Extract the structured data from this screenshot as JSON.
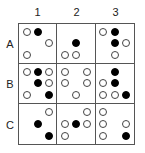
{
  "columns": [
    "1",
    "2",
    "3"
  ],
  "rows": [
    "A",
    "B",
    "C"
  ],
  "legend": {
    "w": "white circle",
    "b": "black circle",
    "-": "empty"
  },
  "colors": {
    "grid_line": "#555555",
    "black_dot": "#000000",
    "white_dot": "#ffffff"
  },
  "cells": {
    "A1": [
      [
        "w",
        "b",
        "-"
      ],
      [
        "-",
        "-",
        "w"
      ],
      [
        "w",
        "-",
        "-"
      ]
    ],
    "A2": [
      [
        "-",
        "-",
        "-"
      ],
      [
        "-",
        "b",
        "-"
      ],
      [
        "w",
        "w",
        "-"
      ]
    ],
    "A3": [
      [
        "w",
        "b",
        "-"
      ],
      [
        "-",
        "b",
        "w"
      ],
      [
        "-",
        "w",
        "-"
      ]
    ],
    "B1": [
      [
        "w",
        "b",
        "w"
      ],
      [
        "-",
        "b",
        "w"
      ],
      [
        "w",
        "-",
        "b"
      ]
    ],
    "B2": [
      [
        "w",
        "-",
        "w"
      ],
      [
        "w",
        "-",
        "w"
      ],
      [
        "-",
        "w",
        "-"
      ]
    ],
    "B3": [
      [
        "-",
        "b",
        "-"
      ],
      [
        "w",
        "b",
        "-"
      ],
      [
        "w",
        "w",
        "b"
      ]
    ],
    "C1": [
      [
        "-",
        "-",
        "w"
      ],
      [
        "-",
        "b",
        "-"
      ],
      [
        "-",
        "-",
        "b"
      ]
    ],
    "C2": [
      [
        "-",
        "-",
        "w"
      ],
      [
        "w",
        "b",
        "w"
      ],
      [
        "w",
        "-",
        "-"
      ]
    ],
    "C3": [
      [
        "w",
        "-",
        "-"
      ],
      [
        "w",
        "-",
        "w"
      ],
      [
        "w",
        "-",
        "b"
      ]
    ]
  }
}
